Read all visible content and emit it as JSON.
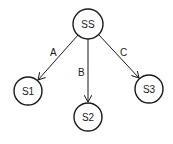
{
  "nodes": [
    {
      "id": "SS",
      "label": "SS"
    },
    {
      "id": "S1",
      "label": "S1"
    },
    {
      "id": "S2",
      "label": "S2"
    },
    {
      "id": "S3",
      "label": "S3"
    }
  ],
  "edges": [
    {
      "from": "SS",
      "to": "S1",
      "label": "A"
    },
    {
      "from": "SS",
      "to": "S2",
      "label": "B"
    },
    {
      "from": "SS",
      "to": "S3",
      "label": "C"
    }
  ],
  "colors": {
    "stroke": "#1a1a1a",
    "background": "#ffffff"
  }
}
